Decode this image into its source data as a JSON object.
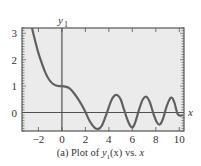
{
  "chart_data": {
    "type": "line",
    "title": "",
    "caption": "(a) Plot of y1(x) vs. x",
    "caption_parts": {
      "prefix": "(a) Plot of ",
      "fn": "y",
      "sub": "1",
      "arg": "(x)",
      "mid": " vs. ",
      "var": "x"
    },
    "xlabel": "x",
    "ylabel": "y1",
    "xlim": [
      -3.4,
      10.4
    ],
    "ylim": [
      -0.7,
      3.2
    ],
    "xticks": [
      -2,
      0,
      2,
      4,
      6,
      8,
      10
    ],
    "yticks": [
      0,
      1,
      2,
      3
    ],
    "grid": false,
    "series": [
      {
        "name": "y1(x)",
        "x": [
          -2.55,
          -2.3,
          -2.0,
          -1.7,
          -1.4,
          -1.1,
          -0.8,
          -0.5,
          -0.2,
          0.0,
          0.3,
          0.6,
          1.0,
          1.4,
          1.8,
          2.0,
          2.4,
          2.8,
          3.1,
          3.4,
          3.8,
          4.2,
          4.5,
          4.75,
          5.0,
          5.3,
          5.6,
          5.9,
          6.1,
          6.3,
          6.6,
          6.9,
          7.2,
          7.5,
          7.8,
          8.1,
          8.35,
          8.6,
          8.9,
          9.2,
          9.4,
          9.6,
          9.85,
          10.1,
          10.3
        ],
        "values": [
          3.2,
          2.75,
          2.25,
          1.85,
          1.5,
          1.25,
          1.1,
          1.02,
          1.0,
          1.0,
          0.98,
          0.93,
          0.75,
          0.5,
          0.2,
          0.02,
          -0.35,
          -0.58,
          -0.62,
          -0.5,
          -0.05,
          0.45,
          0.65,
          0.65,
          0.5,
          0.1,
          -0.3,
          -0.55,
          -0.52,
          -0.3,
          0.15,
          0.5,
          0.6,
          0.38,
          -0.05,
          -0.38,
          -0.45,
          -0.25,
          0.2,
          0.52,
          0.55,
          0.35,
          -0.05,
          -0.12,
          -0.1
        ]
      }
    ]
  },
  "style": {
    "plot_bg": "#ebebeb",
    "frame_color": "#555555",
    "curve_color": "#606060",
    "axis_color": "#505050"
  }
}
